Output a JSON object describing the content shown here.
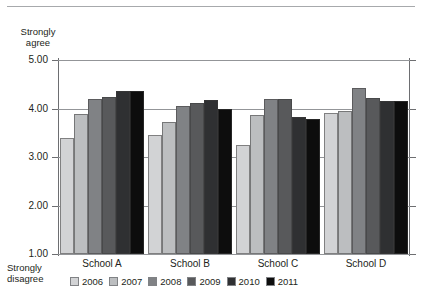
{
  "chart_data": {
    "type": "bar",
    "title": "",
    "subtitle": "",
    "xlabel": "",
    "ylabel": "",
    "ylim": [
      1.0,
      5.0
    ],
    "ytick_labels": [
      "5.00",
      "4.00",
      "3.00",
      "2.00",
      "1.00"
    ],
    "ytick_values": [
      5.0,
      4.0,
      3.0,
      2.0,
      1.0
    ],
    "grid": true,
    "legend_position": "bottom-left",
    "axis_top_caption": {
      "line1": "Strongly",
      "line2": "agree"
    },
    "axis_bottom_caption": {
      "line1": "Strongly",
      "line2": "disagree"
    },
    "categories": [
      "School A",
      "School B",
      "School C",
      "School D"
    ],
    "series": [
      {
        "name": "2006",
        "color": "#d2d3d5",
        "values": [
          3.4,
          3.45,
          3.25,
          3.9
        ]
      },
      {
        "name": "2007",
        "color": "#bcbec0",
        "values": [
          3.88,
          3.72,
          3.87,
          3.95
        ]
      },
      {
        "name": "2008",
        "color": "#808285",
        "values": [
          4.2,
          4.05,
          4.2,
          4.42
        ]
      },
      {
        "name": "2009",
        "color": "#58595b",
        "values": [
          4.23,
          4.12,
          4.2,
          4.22
        ]
      },
      {
        "name": "2010",
        "color": "#2f3032",
        "values": [
          4.36,
          4.18,
          3.82,
          4.15
        ]
      },
      {
        "name": "2011",
        "color": "#0d0d0d",
        "values": [
          4.36,
          4.0,
          3.78,
          4.15
        ]
      }
    ]
  },
  "legend": {
    "items": [
      {
        "label": "2006",
        "color": "#d2d3d5"
      },
      {
        "label": "2007",
        "color": "#bcbec0"
      },
      {
        "label": "2008",
        "color": "#808285"
      },
      {
        "label": "2009",
        "color": "#58595b"
      },
      {
        "label": "2010",
        "color": "#2f3032"
      },
      {
        "label": "2011",
        "color": "#0d0d0d"
      }
    ]
  }
}
